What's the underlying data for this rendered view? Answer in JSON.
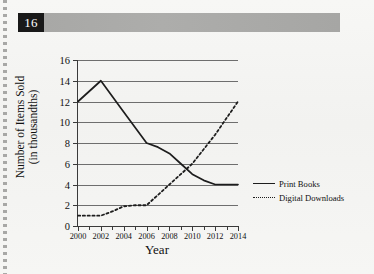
{
  "header": {
    "question_number": "16"
  },
  "chart_data": {
    "type": "line",
    "title": "",
    "xlabel": "Year",
    "ylabel_line1": "Number of Items Sold",
    "ylabel_line2": "(in thousandths)",
    "xlim": [
      2000,
      2014
    ],
    "ylim": [
      0,
      16
    ],
    "x_ticks": [
      2000,
      2002,
      2004,
      2006,
      2008,
      2010,
      2012,
      2014
    ],
    "x_minor_ticks": [
      2001,
      2003,
      2005,
      2007,
      2009,
      2011,
      2013
    ],
    "y_ticks": [
      0,
      2,
      4,
      6,
      8,
      10,
      12,
      14,
      16
    ],
    "grid": "horizontal",
    "legend_position": "right",
    "series": [
      {
        "name": "Print Books",
        "style": "solid",
        "color": "#1d1d1d",
        "x": [
          2000,
          2002,
          2004,
          2006,
          2007,
          2008,
          2009,
          2010,
          2011,
          2012,
          2013,
          2014
        ],
        "values": [
          12,
          14,
          11,
          8,
          7.6,
          7,
          6,
          5,
          4.4,
          4,
          4,
          4
        ]
      },
      {
        "name": "Digital Downloads",
        "style": "dotted",
        "color": "#1d1d1d",
        "x": [
          2000,
          2001,
          2002,
          2003,
          2004,
          2005,
          2006,
          2007,
          2008,
          2009,
          2010,
          2011,
          2012,
          2013,
          2014
        ],
        "values": [
          1,
          1,
          1,
          1.4,
          1.9,
          2,
          2,
          3,
          4,
          5,
          6,
          7.4,
          8.8,
          10.4,
          12
        ]
      }
    ]
  },
  "colors": {
    "badge_background": "#191919",
    "badge_text": "#ffffff",
    "banner": "#a9a9a7",
    "paper": "#f4f4f2",
    "axis": "#3a3a3a",
    "gridline": "#6e6e6e",
    "ink": "#1d1d1d"
  }
}
